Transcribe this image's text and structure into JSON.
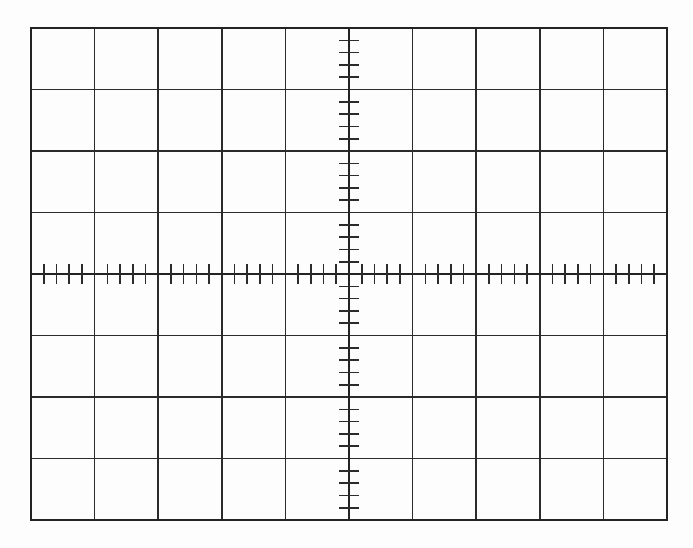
{
  "page": {
    "width": 693,
    "height": 548,
    "background_color": "#fdfdfd"
  },
  "graticule": {
    "name": "oscilloscope-graticule",
    "description": "Blank oscilloscope screen graticule with 10 horizontal divisions by 8 vertical divisions and fine subdivision tick marks on the centre axes",
    "line_color": "#2b2b2b",
    "border_color": "#232323",
    "axis_color": "#232323",
    "tick_color": "#2b2b2b",
    "border_width": 2.0,
    "grid_line_width": 1.5,
    "axis_line_width": 1.8,
    "tick_line_width": 1.6,
    "plot_left": 31,
    "plot_top": 28,
    "plot_right": 667,
    "plot_bottom": 520,
    "columns": 10,
    "rows": 8,
    "subdivisions_per_division": 5,
    "ticks_per_division": 4,
    "tick_length": 20,
    "center_x_division": 5,
    "center_y_division": 4
  },
  "chart_data": {
    "type": "line",
    "title": "",
    "subtitle": "",
    "xlabel": "",
    "ylabel": "",
    "grid": true,
    "legend": null,
    "legend_position": "none",
    "series": [],
    "x": [],
    "categories": [],
    "values": [],
    "annotations": [],
    "axes": {
      "horizontal": {
        "name": "horizontal-centre-axis",
        "divisions": 10,
        "divisions_left_of_centre": 5,
        "divisions_right_of_centre": 5,
        "minor_ticks_per_division": 4,
        "tick_fraction": 0.2
      },
      "vertical": {
        "name": "vertical-centre-axis",
        "divisions": 8,
        "divisions_above_centre": 4,
        "divisions_below_centre": 4,
        "minor_ticks_per_division": 4,
        "tick_fraction": 0.2
      }
    },
    "xlim": [
      -5,
      5
    ],
    "ylim": [
      -4,
      4
    ],
    "x_tick_labels": [],
    "y_tick_labels": []
  }
}
